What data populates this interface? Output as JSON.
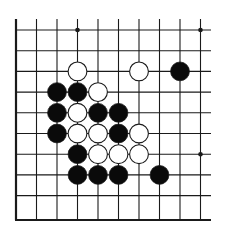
{
  "board": {
    "title": "Go board fragment",
    "columns": 10,
    "rows": 10,
    "grid": {
      "x0": 16,
      "dx": 20.5,
      "y0": 30,
      "dy": 20.7,
      "top_extent": 19,
      "right_extent": 211,
      "bottom_edge": 220
    },
    "edges": [
      "left",
      "bottom"
    ],
    "star_points": [
      {
        "col": 3,
        "row": 0
      },
      {
        "col": 9,
        "row": 0
      },
      {
        "col": 9,
        "row": 6
      }
    ],
    "stones": [
      {
        "color": "white",
        "col": 3,
        "row": 2
      },
      {
        "color": "white",
        "col": 6,
        "row": 2
      },
      {
        "color": "black",
        "col": 8,
        "row": 2
      },
      {
        "color": "black",
        "col": 2,
        "row": 3
      },
      {
        "color": "black",
        "col": 3,
        "row": 3
      },
      {
        "color": "white",
        "col": 4,
        "row": 3
      },
      {
        "color": "black",
        "col": 2,
        "row": 4
      },
      {
        "color": "white",
        "col": 3,
        "row": 4
      },
      {
        "color": "black",
        "col": 4,
        "row": 4
      },
      {
        "color": "black",
        "col": 5,
        "row": 4
      },
      {
        "color": "black",
        "col": 2,
        "row": 5
      },
      {
        "color": "white",
        "col": 3,
        "row": 5
      },
      {
        "color": "white",
        "col": 4,
        "row": 5
      },
      {
        "color": "black",
        "col": 5,
        "row": 5
      },
      {
        "color": "white",
        "col": 6,
        "row": 5
      },
      {
        "color": "black",
        "col": 3,
        "row": 6
      },
      {
        "color": "white",
        "col": 4,
        "row": 6
      },
      {
        "color": "white",
        "col": 5,
        "row": 6
      },
      {
        "color": "white",
        "col": 6,
        "row": 6
      },
      {
        "color": "black",
        "col": 3,
        "row": 7
      },
      {
        "color": "black",
        "col": 4,
        "row": 7
      },
      {
        "color": "black",
        "col": 5,
        "row": 7
      },
      {
        "color": "black",
        "col": 7,
        "row": 7
      }
    ],
    "colors": {
      "line": "#1a1a1a",
      "black_stone": "#0a0a0a",
      "white_stone": "#ffffff",
      "background": "#ffffff"
    }
  }
}
